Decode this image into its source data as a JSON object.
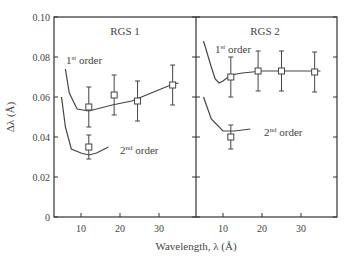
{
  "chart_data": [
    {
      "type": "line",
      "panel": "RGS 1",
      "title": "RGS 1",
      "xlabel": "Wavelength, λ (Å)",
      "ylabel": "Δλ (Å)",
      "xlim": [
        3,
        38
      ],
      "ylim": [
        0,
        0.1
      ],
      "xticks": [
        10,
        20,
        30
      ],
      "yticks": [
        0,
        0.02,
        0.04,
        0.06,
        0.08,
        0.1
      ],
      "grid": false,
      "series": [
        {
          "name": "1st order",
          "kind": "model-curve",
          "x": [
            6,
            7,
            9,
            12,
            18,
            23,
            28,
            33,
            35
          ],
          "y": [
            0.074,
            0.062,
            0.054,
            0.053,
            0.056,
            0.058,
            0.062,
            0.066,
            0.067
          ]
        },
        {
          "name": "1st order",
          "kind": "measured",
          "x": [
            12,
            18.5,
            24.5,
            33.5
          ],
          "y": [
            0.055,
            0.061,
            0.058,
            0.066
          ],
          "yerr": [
            0.01,
            0.01,
            0.01,
            0.01
          ]
        },
        {
          "name": "2nd order",
          "kind": "model-curve",
          "x": [
            5,
            6,
            7.5,
            10,
            12,
            14,
            17
          ],
          "y": [
            0.06,
            0.045,
            0.034,
            0.032,
            0.031,
            0.032,
            0.035
          ]
        },
        {
          "name": "2nd order",
          "kind": "measured",
          "x": [
            12
          ],
          "y": [
            0.035
          ],
          "yerr": [
            0.006
          ]
        }
      ],
      "annotations": [
        "1st order",
        "2nd order"
      ]
    },
    {
      "type": "line",
      "panel": "RGS 2",
      "title": "RGS 2",
      "xlabel": "Wavelength, λ (Å)",
      "ylabel": "Δλ (Å)",
      "xlim": [
        3,
        38
      ],
      "ylim": [
        0,
        0.1
      ],
      "xticks": [
        10,
        20,
        30
      ],
      "yticks": [
        0,
        0.02,
        0.04,
        0.06,
        0.08,
        0.1
      ],
      "grid": false,
      "series": [
        {
          "name": "1st order",
          "kind": "model-curve",
          "x": [
            5,
            7,
            8,
            9,
            10,
            12,
            15,
            20,
            30,
            35
          ],
          "y": [
            0.088,
            0.075,
            0.069,
            0.067,
            0.068,
            0.071,
            0.072,
            0.073,
            0.073,
            0.073
          ]
        },
        {
          "name": "1st order",
          "kind": "measured",
          "x": [
            12,
            19,
            25,
            33.5
          ],
          "y": [
            0.07,
            0.073,
            0.073,
            0.0725
          ],
          "yerr": [
            0.01,
            0.01,
            0.01,
            0.01
          ]
        },
        {
          "name": "2nd order",
          "kind": "model-curve",
          "x": [
            5,
            7,
            10,
            13,
            17
          ],
          "y": [
            0.06,
            0.049,
            0.043,
            0.043,
            0.044
          ]
        },
        {
          "name": "2nd order",
          "kind": "measured",
          "x": [
            12
          ],
          "y": [
            0.04
          ],
          "yerr": [
            0.006
          ]
        }
      ],
      "annotations": [
        "1st order",
        "2nd order"
      ]
    }
  ],
  "labels": {
    "panel1_title": "RGS 1",
    "panel2_title": "RGS 2",
    "xlabel": "Wavelength, λ (Å)",
    "ylabel": "Δλ (Å)",
    "first_order_base": "1",
    "first_order_sup": "st",
    "first_order_rest": " order",
    "second_order_base": "2",
    "second_order_sup": "nd",
    "second_order_rest": " order",
    "yticks": [
      "0",
      "0.02",
      "0.04",
      "0.06",
      "0.08",
      "0.10"
    ],
    "xticks": [
      "10",
      "20",
      "30"
    ]
  },
  "colors": {
    "line": "#444444",
    "axis": "#333333",
    "text": "#444444"
  }
}
